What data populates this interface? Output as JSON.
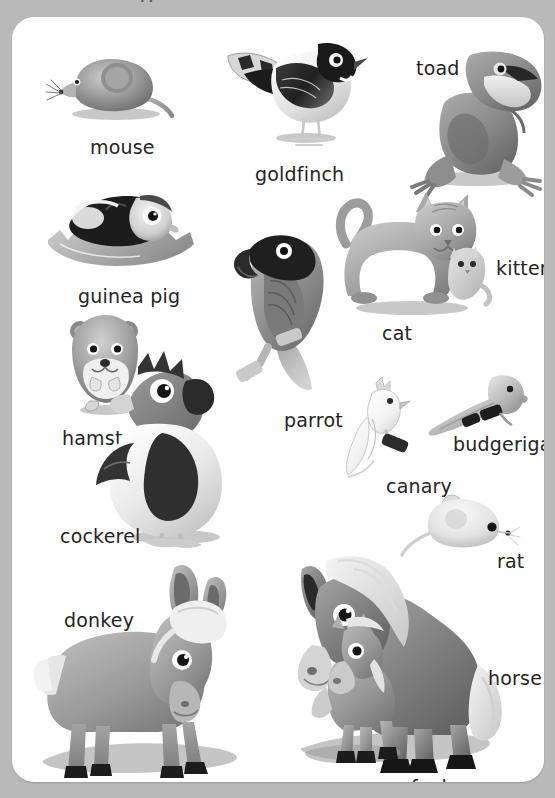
{
  "page": {
    "kind": "picture-dictionary-page",
    "background_color": "#b9b9b9",
    "card_color": "#ffffff",
    "text_color": "#242424",
    "partial_title_fragment": "g"
  },
  "entries": [
    {
      "id": "mouse",
      "label": "mouse",
      "label_x": 78,
      "label_y": 119,
      "art_x": 44,
      "art_y": 42,
      "art_w": 130,
      "art_h": 78
    },
    {
      "id": "goldfinch",
      "label": "goldfinch",
      "label_x": 243,
      "label_y": 146,
      "art_x": 218,
      "art_y": 22,
      "art_w": 140,
      "art_h": 115
    },
    {
      "id": "toad",
      "label": "toad",
      "label_x": 404,
      "label_y": 40,
      "art_x": 400,
      "art_y": 40,
      "art_w": 140,
      "art_h": 125
    },
    {
      "id": "guinea-pig",
      "label": "guinea pig",
      "label_x": 66,
      "label_y": 268,
      "art_x": 40,
      "art_y": 178,
      "art_w": 150,
      "art_h": 85
    },
    {
      "id": "parrot",
      "label": "parrot",
      "label_x": 272,
      "label_y": 392,
      "art_x": 222,
      "art_y": 218,
      "art_w": 115,
      "art_h": 165
    },
    {
      "id": "cat",
      "label": "cat",
      "label_x": 370,
      "label_y": 305,
      "art_x": 328,
      "art_y": 178,
      "art_w": 160,
      "art_h": 118
    },
    {
      "id": "kitten",
      "label": "kitten",
      "label_x": 484,
      "label_y": 240,
      "art_x": 440,
      "art_y": 228,
      "art_w": 55,
      "art_h": 70
    },
    {
      "id": "hamster",
      "label": "hamster",
      "label_x": 50,
      "label_y": 410,
      "art_x": 58,
      "art_y": 300,
      "art_w": 75,
      "art_h": 100
    },
    {
      "id": "cockerel",
      "label": "cockerel",
      "label_x": 48,
      "label_y": 508,
      "art_x": 100,
      "art_y": 330,
      "art_w": 125,
      "art_h": 195
    },
    {
      "id": "canary",
      "label": "canary",
      "label_x": 374,
      "label_y": 458,
      "art_x": 336,
      "art_y": 368,
      "art_w": 70,
      "art_h": 90
    },
    {
      "id": "budgerigar",
      "label": "budgerigar",
      "label_x": 441,
      "label_y": 416,
      "art_x": 420,
      "art_y": 362,
      "art_w": 90,
      "art_h": 60
    },
    {
      "id": "rat",
      "label": "rat",
      "label_x": 485,
      "label_y": 533,
      "art_x": 402,
      "art_y": 482,
      "art_w": 100,
      "art_h": 60
    },
    {
      "id": "donkey",
      "label": "donkey",
      "label_x": 52,
      "label_y": 592,
      "art_x": 20,
      "art_y": 548,
      "art_w": 215,
      "art_h": 215
    },
    {
      "id": "horse",
      "label": "horse",
      "label_x": 476,
      "label_y": 650,
      "art_x": 265,
      "art_y": 540,
      "art_w": 200,
      "art_h": 200
    },
    {
      "id": "foal",
      "label": "foal",
      "label_x": 399,
      "label_y": 759,
      "art_x": 292,
      "art_y": 610,
      "art_w": 95,
      "art_h": 135
    }
  ],
  "icons": {
    "mouse": "mouse-icon",
    "goldfinch": "goldfinch-icon",
    "toad": "toad-icon",
    "guinea-pig": "guinea-pig-icon",
    "parrot": "parrot-icon",
    "cat": "cat-icon",
    "kitten": "kitten-icon",
    "hamster": "hamster-icon",
    "cockerel": "cockerel-icon",
    "canary": "canary-icon",
    "budgerigar": "budgerigar-icon",
    "rat": "rat-icon",
    "donkey": "donkey-icon",
    "horse": "horse-icon",
    "foal": "foal-icon"
  }
}
